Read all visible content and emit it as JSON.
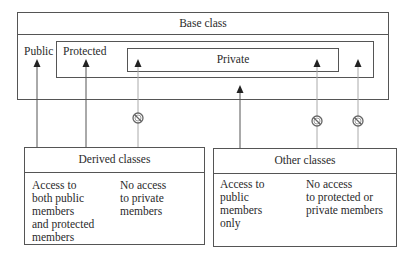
{
  "base_class": {
    "title": "Base class",
    "public_label": "Public",
    "protected_label": "Protected",
    "private_label": "Private"
  },
  "derived_classes": {
    "title": "Derived classes",
    "access_text": "Access to\nboth public\nmembers\nand protected\nmembers",
    "no_access_text": "No access\nto private\nmembers"
  },
  "other_classes": {
    "title": "Other classes",
    "access_text": "Access to\npublic\nmembers\nonly",
    "no_access_text": "No access\nto protected or\nprivate members"
  },
  "arrows": [
    {
      "from": "derived_classes",
      "to": "public",
      "allowed": true
    },
    {
      "from": "derived_classes",
      "to": "protected",
      "allowed": true
    },
    {
      "from": "derived_classes",
      "to": "private",
      "allowed": false
    },
    {
      "from": "other_classes",
      "to": "public",
      "allowed": true
    },
    {
      "from": "other_classes",
      "to": "private",
      "allowed": false
    },
    {
      "from": "other_classes",
      "to": "protected",
      "allowed": false
    }
  ],
  "icons": {
    "blocked": "prohibited-icon",
    "arrowhead": "triangle-up"
  },
  "colors": {
    "line": "#555555",
    "blocked_line": "#9a9a9a",
    "text": "#2a2a2a"
  }
}
